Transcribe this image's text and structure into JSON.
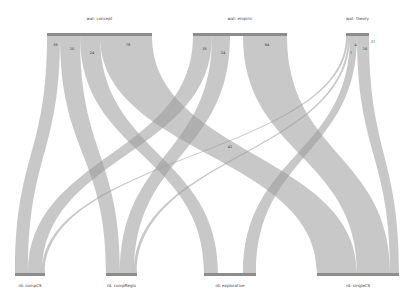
{
  "chart_data": {
    "type": "sankey",
    "title": "",
    "top_nodes": [
      {
        "id": "concept",
        "label": "wat: concept",
        "x0": 47,
        "x1": 152
      },
      {
        "id": "empiric",
        "label": "wat: empiric",
        "x0": 193,
        "x1": 287
      },
      {
        "id": "theory",
        "label": "wat: theory",
        "x0": 346,
        "x1": 369
      }
    ],
    "bottom_nodes": [
      {
        "id": "compCS",
        "label": "rd: compCS",
        "x0": 15,
        "x1": 45
      },
      {
        "id": "compRegio",
        "label": "rd: compRegio",
        "x0": 106,
        "x1": 137
      },
      {
        "id": "explorative",
        "label": "rd: explorative",
        "x0": 204,
        "x1": 256
      },
      {
        "id": "singleCS",
        "label": "rd: singleCS",
        "x0": 317,
        "x1": 399
      }
    ],
    "links": [
      {
        "source": "concept",
        "target": "compCS",
        "value": 35,
        "sx0": 47,
        "sx1": 60,
        "tx0": 15,
        "tx1": 28,
        "label": "35"
      },
      {
        "source": "concept",
        "target": "compRegio",
        "value": 10,
        "sx0": 60,
        "sx1": 80,
        "tx0": 106,
        "tx1": 120,
        "label": "10"
      },
      {
        "source": "concept",
        "target": "explorative",
        "value": 24,
        "sx0": 80,
        "sx1": 100,
        "tx0": 204,
        "tx1": 218,
        "label": "24"
      },
      {
        "source": "concept",
        "target": "singleCS",
        "value": 78,
        "sx0": 100,
        "sx1": 152,
        "tx0": 317,
        "tx1": 357,
        "label": "78"
      },
      {
        "source": "empiric",
        "target": "compCS",
        "value": 35,
        "sx0": 193,
        "sx1": 212,
        "tx0": 28,
        "tx1": 42,
        "label": "35"
      },
      {
        "source": "empiric",
        "target": "compRegio",
        "value": 24,
        "sx0": 212,
        "sx1": 230,
        "tx0": 120,
        "tx1": 134,
        "label": "24"
      },
      {
        "source": "empiric",
        "target": "singleCS",
        "value": 84,
        "sx0": 243,
        "sx1": 287,
        "tx0": 357,
        "tx1": 390,
        "label": "84"
      },
      {
        "source": "theory",
        "target": "compCS",
        "value": 1,
        "sx0": 346,
        "sx1": 348,
        "tx0": 42,
        "tx1": 45,
        "label": ""
      },
      {
        "source": "theory",
        "target": "compRegio",
        "value": 1,
        "sx0": 348,
        "sx1": 350,
        "tx0": 134,
        "tx1": 137,
        "label": "7"
      },
      {
        "source": "theory",
        "target": "explorative",
        "value": 7,
        "sx0": 350,
        "sx1": 357,
        "tx0": 243,
        "tx1": 256,
        "label": "4"
      },
      {
        "source": "theory",
        "target": "singleCS",
        "value": 16,
        "sx0": 357,
        "sx1": 369,
        "tx0": 390,
        "tx1": 399,
        "label": "16"
      }
    ],
    "annotations": [
      {
        "text": "41",
        "x": 230,
        "y": 148
      },
      {
        "text": "37",
        "x": 373,
        "y": 43
      }
    ],
    "layout": {
      "top_y": 33,
      "bottom_y": 273,
      "node_bar_height": 3
    }
  }
}
